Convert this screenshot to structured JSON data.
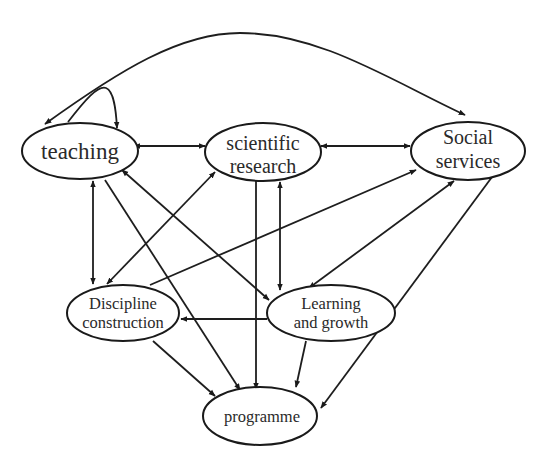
{
  "diagram": {
    "type": "directed-graph",
    "nodes": {
      "teaching": {
        "label": "teaching"
      },
      "scientific_research": {
        "line1": "scientific",
        "line2": "research"
      },
      "social_services": {
        "line1": "Social",
        "line2": "services"
      },
      "discipline_construction": {
        "line1": "Discipline",
        "line2": "construction"
      },
      "learning_growth": {
        "line1": "Learning",
        "line2": "and growth"
      },
      "programme": {
        "label": "programme"
      }
    },
    "edges": [
      {
        "from": "teaching",
        "to": "teaching",
        "kind": "self-loop"
      },
      {
        "from": "teaching",
        "to": "social_services",
        "kind": "bidirectional-arc"
      },
      {
        "from": "teaching",
        "to": "scientific_research",
        "kind": "bidirectional"
      },
      {
        "from": "scientific_research",
        "to": "social_services",
        "kind": "bidirectional"
      },
      {
        "from": "teaching",
        "to": "discipline_construction",
        "kind": "bidirectional"
      },
      {
        "from": "teaching",
        "to": "learning_growth",
        "kind": "bidirectional"
      },
      {
        "from": "teaching",
        "to": "programme",
        "kind": "directed"
      },
      {
        "from": "scientific_research",
        "to": "discipline_construction",
        "kind": "bidirectional"
      },
      {
        "from": "scientific_research",
        "to": "programme",
        "kind": "directed"
      },
      {
        "from": "scientific_research",
        "to": "learning_growth",
        "kind": "bidirectional"
      },
      {
        "from": "discipline_construction",
        "to": "social_services",
        "kind": "directed"
      },
      {
        "from": "learning_growth",
        "to": "social_services",
        "kind": "bidirectional"
      },
      {
        "from": "social_services",
        "to": "programme",
        "kind": "directed"
      },
      {
        "from": "learning_growth",
        "to": "discipline_construction",
        "kind": "directed"
      },
      {
        "from": "discipline_construction",
        "to": "programme",
        "kind": "directed"
      },
      {
        "from": "learning_growth",
        "to": "programme",
        "kind": "directed"
      }
    ]
  }
}
